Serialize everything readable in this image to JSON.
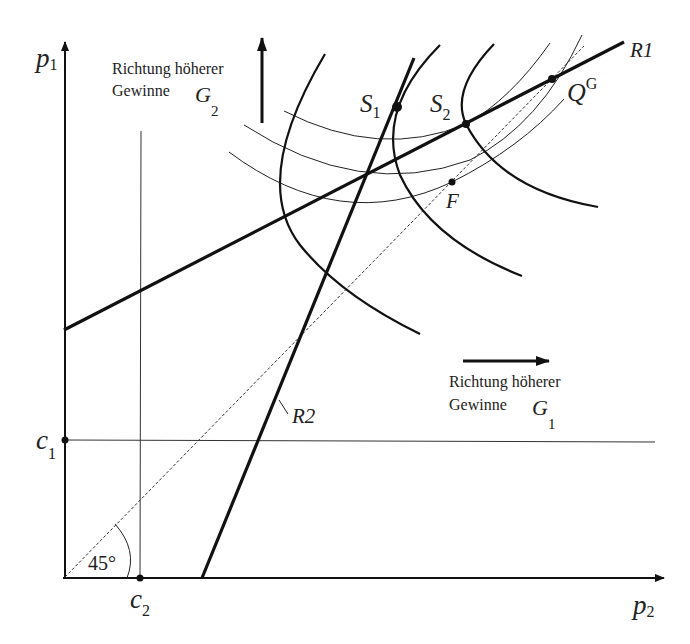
{
  "axes": {
    "y_label": "p",
    "y_sub": "1",
    "x_label": "p",
    "x_sub": "2",
    "c1_label": "c",
    "c1_sub": "1",
    "c2_label": "c",
    "c2_sub": "2"
  },
  "angle_label": "45°",
  "reaction_curves": {
    "r1_label": "R1",
    "r2_label": "R2"
  },
  "points": {
    "s1_label": "S",
    "s1_sub": "1",
    "s2_label": "S",
    "s2_sub": "2",
    "qg_label": "Q",
    "qg_sup": "G",
    "f_label": "F"
  },
  "annotations": {
    "g2_line1": "Richtung höherer",
    "g2_line2": "Gewinne",
    "g2_sym": "G",
    "g2_sub": "2",
    "g1_line1": "Richtung höherer",
    "g1_line2": "Gewinne",
    "g1_sym": "G",
    "g1_sub": "1"
  },
  "colors": {
    "ink": "#111111",
    "background": "#ffffff"
  }
}
